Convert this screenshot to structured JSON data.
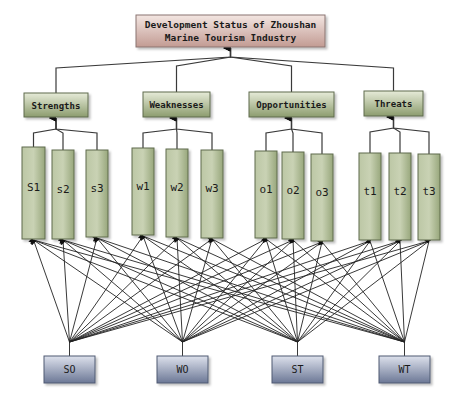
{
  "title": {
    "line1": "Development Status of Zhoushan",
    "line2": "Marine Tourism Industry"
  },
  "categories": [
    {
      "id": "strengths",
      "label": "Strengths",
      "x": 24,
      "y": 93,
      "w": 64,
      "h": 24,
      "factors": [
        {
          "label": "S1",
          "x": 22,
          "w": 23,
          "y": 147,
          "h": 92
        },
        {
          "label": "s2",
          "x": 52,
          "w": 22,
          "y": 150,
          "h": 89
        },
        {
          "label": "s3",
          "x": 86,
          "w": 22,
          "y": 150,
          "h": 87
        }
      ]
    },
    {
      "id": "weaknesses",
      "label": "Weaknesses",
      "x": 143,
      "y": 92,
      "w": 67,
      "h": 25,
      "factors": [
        {
          "label": "w1",
          "x": 132,
          "w": 22,
          "y": 148,
          "h": 87
        },
        {
          "label": "w2",
          "x": 166,
          "w": 22,
          "y": 149,
          "h": 88
        },
        {
          "label": "w3",
          "x": 201,
          "w": 22,
          "y": 150,
          "h": 88
        }
      ]
    },
    {
      "id": "opportunities",
      "label": "Opportunities",
      "x": 249,
      "y": 92,
      "w": 85,
      "h": 25,
      "factors": [
        {
          "label": "o1",
          "x": 255,
          "w": 22,
          "y": 151,
          "h": 87
        },
        {
          "label": "o2",
          "x": 282,
          "w": 22,
          "y": 152,
          "h": 87
        },
        {
          "label": "o3",
          "x": 311,
          "w": 22,
          "y": 154,
          "h": 87
        }
      ]
    },
    {
      "id": "threats",
      "label": "Threats",
      "x": 364,
      "y": 91,
      "w": 59,
      "h": 25,
      "factors": [
        {
          "label": "t1",
          "x": 359,
          "w": 22,
          "y": 153,
          "h": 87
        },
        {
          "label": "t2",
          "x": 389,
          "w": 22,
          "y": 153,
          "h": 87
        },
        {
          "label": "t3",
          "x": 418,
          "w": 22,
          "y": 154,
          "h": 86
        }
      ]
    }
  ],
  "strategies": [
    {
      "label": "SO",
      "x": 44,
      "y": 356,
      "w": 51,
      "h": 27
    },
    {
      "label": "WO",
      "x": 157,
      "y": 356,
      "w": 51,
      "h": 27
    },
    {
      "label": "ST",
      "x": 272,
      "y": 356,
      "w": 51,
      "h": 27
    },
    {
      "label": "WT",
      "x": 379,
      "y": 356,
      "w": 51,
      "h": 27
    }
  ],
  "colors": {
    "title_fill_top": "#f2e3df",
    "title_fill_bottom": "#c9a39b",
    "green_fill_light": "#e4e9d6",
    "green_fill_dark": "#8a9b6c",
    "blue_fill_light": "#d7dce8",
    "blue_fill_dark": "#6d7a98",
    "line": "#333333"
  }
}
